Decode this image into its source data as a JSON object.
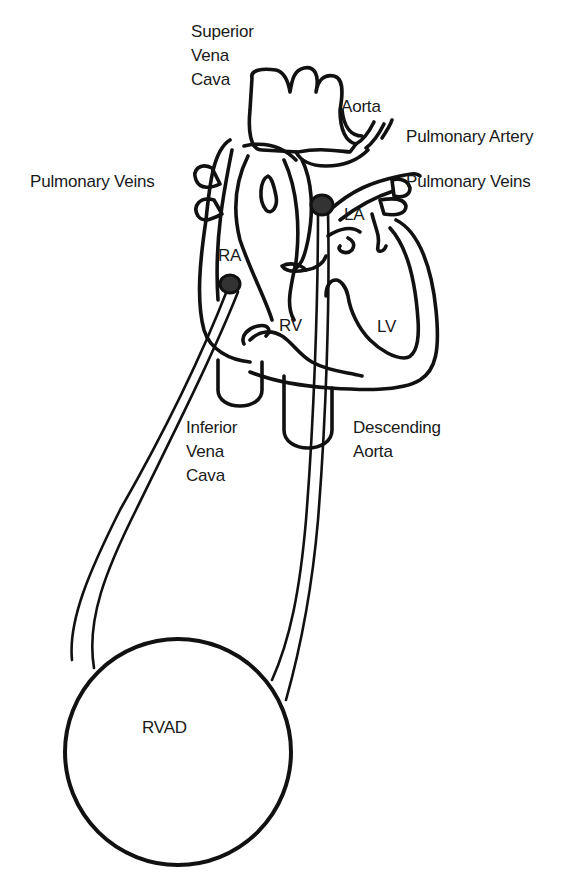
{
  "diagram": {
    "labels": {
      "superior_vena_cava": "Superior\nVena\nCava",
      "aorta": "Aorta",
      "pulmonary_artery": "Pulmonary Artery",
      "pulmonary_veins_left": "Pulmonary Veins",
      "pulmonary_veins_right": "Pulmonary Veins",
      "ra": "RA",
      "la": "LA",
      "rv": "RV",
      "lv": "LV",
      "inferior_vena_cava": "Inferior\nVena\nCava",
      "descending_aorta": "Descending\nAorta",
      "rvad": "RVAD"
    },
    "connections": [
      {
        "from": "RA",
        "to": "RVAD",
        "role": "inflow cannula"
      },
      {
        "from": "RVAD",
        "to": "Pulmonary Artery",
        "role": "outflow cannula"
      }
    ],
    "colors": {
      "line": "#111111",
      "background": "#ffffff",
      "cannula_tip": "#333333"
    }
  }
}
